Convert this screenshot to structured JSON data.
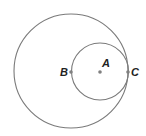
{
  "diagram": {
    "type": "geometry",
    "colors": {
      "stroke": "#7a7a7a",
      "point": "#808080",
      "label": "#222222",
      "background": "#ffffff"
    },
    "large_circle": {
      "cx": 71,
      "cy": 71,
      "r": 57
    },
    "small_circle": {
      "cx": 100,
      "cy": 71.5,
      "r": 28.5
    },
    "points": [
      {
        "name": "B",
        "label": "B",
        "x": 71,
        "y": 72,
        "label_x": 60,
        "label_y": 76
      },
      {
        "name": "A",
        "label": "A",
        "x": 100,
        "y": 72,
        "label_x": 102,
        "label_y": 67
      },
      {
        "name": "C",
        "label": "C",
        "x": 128,
        "y": 72,
        "label_x": 131,
        "label_y": 76
      }
    ]
  }
}
